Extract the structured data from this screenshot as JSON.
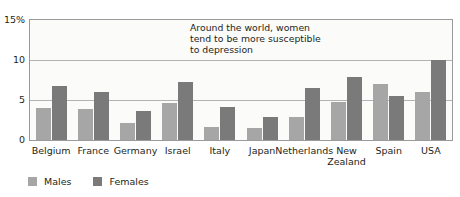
{
  "chart_data": {
    "type": "bar",
    "title": "",
    "subtitle": "",
    "xlabel": "",
    "ylabel": "",
    "ylim": [
      0,
      15
    ],
    "yticks": [
      "0",
      "5",
      "10",
      "15%"
    ],
    "ytick_values": [
      0,
      5,
      10,
      15
    ],
    "grid": true,
    "grid_axis": "y",
    "legend_position": "bottom-left",
    "annotations": [
      "Around the world, women\ntend to be more susceptible\nto depression"
    ],
    "categories": [
      "Belgium",
      "France",
      "Germany",
      "Israel",
      "Italy",
      "Japan",
      "Netherlands",
      "New\nZealand",
      "Spain",
      "USA"
    ],
    "series": [
      {
        "name": "Males",
        "color": "#a6a6a6",
        "values": [
          4.0,
          3.9,
          2.1,
          4.6,
          1.6,
          1.5,
          2.9,
          4.8,
          7.0,
          6.0
        ]
      },
      {
        "name": "Females",
        "color": "#7a7a7a",
        "values": [
          6.8,
          6.0,
          3.6,
          7.2,
          4.1,
          2.9,
          6.5,
          7.9,
          5.5,
          10.0
        ]
      }
    ]
  },
  "legend": {
    "items": [
      {
        "label": "Males",
        "color": "#a6a6a6"
      },
      {
        "label": "Females",
        "color": "#7a7a7a"
      }
    ]
  },
  "colors": {
    "males": "#a6a6a6",
    "females": "#7a7a7a",
    "gridline": "#b3b3b3",
    "frame": "#9a9a9a",
    "plot_background": "#fbfbfa",
    "text": "#231f20"
  }
}
